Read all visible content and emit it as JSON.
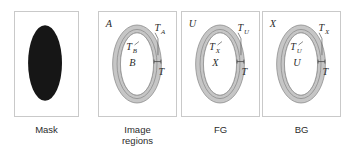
{
  "figure": {
    "width": 351,
    "height": 159,
    "background": "#ffffff",
    "band_fill": "#c6c6c6",
    "band_stroke": "#8c8c8c",
    "mask_fill": "#161616",
    "panel_border": "#c9c9c9"
  },
  "panels": [
    {
      "id": "mask",
      "caption": "Mask",
      "type": "mask",
      "labels": []
    },
    {
      "id": "image-regions",
      "caption": "Image\nregions",
      "type": "ring",
      "labels": [
        {
          "name": "region-a",
          "base": "A",
          "sub": "",
          "pos": "top-left"
        },
        {
          "name": "band-ta",
          "base": "T",
          "sub": "A",
          "pos": "top-right"
        },
        {
          "name": "band-tb",
          "base": "T",
          "sub": "B",
          "pos": "inner-upper"
        },
        {
          "name": "region-b",
          "base": "B",
          "sub": "",
          "pos": "inner-lower"
        },
        {
          "name": "band-t",
          "base": "T",
          "sub": "",
          "pos": "right-mid"
        }
      ]
    },
    {
      "id": "fg",
      "caption": "FG",
      "type": "ring",
      "labels": [
        {
          "name": "region-u",
          "base": "U",
          "sub": "",
          "pos": "top-left"
        },
        {
          "name": "band-tu",
          "base": "T",
          "sub": "U",
          "pos": "top-right"
        },
        {
          "name": "band-tx",
          "base": "T",
          "sub": "X",
          "pos": "inner-upper"
        },
        {
          "name": "region-x",
          "base": "X",
          "sub": "",
          "pos": "inner-lower"
        },
        {
          "name": "band-t",
          "base": "T",
          "sub": "",
          "pos": "right-mid"
        }
      ]
    },
    {
      "id": "bg",
      "caption": "BG",
      "type": "ring",
      "labels": [
        {
          "name": "region-x",
          "base": "X",
          "sub": "",
          "pos": "top-left"
        },
        {
          "name": "band-tx",
          "base": "T",
          "sub": "X",
          "pos": "top-right"
        },
        {
          "name": "band-tu",
          "base": "T",
          "sub": "U",
          "pos": "inner-upper"
        },
        {
          "name": "region-u",
          "base": "U",
          "sub": "",
          "pos": "inner-lower"
        },
        {
          "name": "band-t",
          "base": "T",
          "sub": "",
          "pos": "right-mid"
        }
      ]
    }
  ]
}
